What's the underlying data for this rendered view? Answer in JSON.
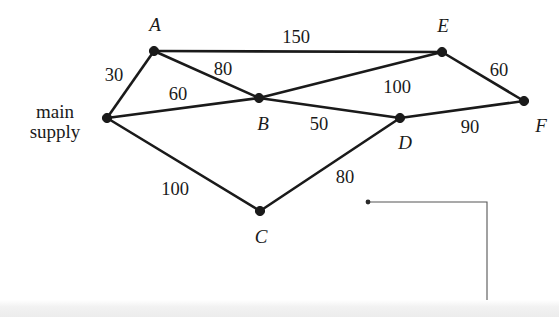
{
  "figure": {
    "type": "weighted-network-graph",
    "title": "",
    "background_color": "#ffffff",
    "edge_color": "#1a1a1a",
    "node_color": "#1a1a1a",
    "leader_color": "#555555"
  },
  "nodes": [
    {
      "id": "S",
      "label": "main\nsupply",
      "label_line1": "main",
      "label_line2": "supply",
      "x": 107,
      "y": 118,
      "label_x": 55,
      "label_y": 122,
      "label_kind": "text"
    },
    {
      "id": "A",
      "label": "A",
      "x": 154,
      "y": 51,
      "label_x": 155,
      "label_y": 25,
      "label_kind": "italic"
    },
    {
      "id": "B",
      "label": "B",
      "x": 259,
      "y": 98,
      "label_x": 263,
      "label_y": 124,
      "label_kind": "italic"
    },
    {
      "id": "C",
      "label": "C",
      "x": 260,
      "y": 211,
      "label_x": 261,
      "label_y": 237,
      "label_kind": "italic"
    },
    {
      "id": "D",
      "label": "D",
      "x": 400,
      "y": 118,
      "label_x": 405,
      "label_y": 143,
      "label_kind": "italic"
    },
    {
      "id": "E",
      "label": "E",
      "x": 442,
      "y": 52,
      "label_x": 443,
      "label_y": 26,
      "label_kind": "italic"
    },
    {
      "id": "F",
      "label": "F",
      "x": 524,
      "y": 101,
      "label_x": 541,
      "label_y": 126,
      "label_kind": "italic"
    }
  ],
  "edges": [
    {
      "from": "S",
      "to": "A",
      "weight": "30",
      "label_x": 114,
      "label_y": 76
    },
    {
      "from": "S",
      "to": "B",
      "weight": "60",
      "label_x": 178,
      "label_y": 95
    },
    {
      "from": "S",
      "to": "C",
      "weight": "100",
      "label_x": 175,
      "label_y": 190
    },
    {
      "from": "A",
      "to": "E",
      "weight": "150",
      "label_x": 296,
      "label_y": 38
    },
    {
      "from": "A",
      "to": "B",
      "weight": "80",
      "label_x": 223,
      "label_y": 70
    },
    {
      "from": "B",
      "to": "E",
      "weight": "100",
      "label_x": 397,
      "label_y": 88
    },
    {
      "from": "B",
      "to": "D",
      "weight": "50",
      "label_x": 319,
      "label_y": 125
    },
    {
      "from": "C",
      "to": "D",
      "weight": "80",
      "label_x": 345,
      "label_y": 178
    },
    {
      "from": "E",
      "to": "F",
      "weight": "60",
      "label_x": 499,
      "label_y": 71
    },
    {
      "from": "D",
      "to": "F",
      "weight": "90",
      "label_x": 470,
      "label_y": 128
    }
  ],
  "annotation": {
    "name": "leader-line",
    "dot_x": 368,
    "dot_y": 202,
    "corner_x": 487,
    "corner_y": 202,
    "end_x": 487,
    "end_y": 317
  },
  "chart_data": {
    "type": "graph",
    "vertices": [
      "main supply",
      "A",
      "B",
      "C",
      "D",
      "E",
      "F"
    ],
    "edges": [
      {
        "u": "main supply",
        "v": "A",
        "weight": 30
      },
      {
        "u": "main supply",
        "v": "B",
        "weight": 60
      },
      {
        "u": "main supply",
        "v": "C",
        "weight": 100
      },
      {
        "u": "A",
        "v": "E",
        "weight": 150
      },
      {
        "u": "A",
        "v": "B",
        "weight": 80
      },
      {
        "u": "B",
        "v": "E",
        "weight": 100
      },
      {
        "u": "B",
        "v": "D",
        "weight": 50
      },
      {
        "u": "C",
        "v": "D",
        "weight": 80
      },
      {
        "u": "E",
        "v": "F",
        "weight": 60
      },
      {
        "u": "D",
        "v": "F",
        "weight": 90
      }
    ],
    "weights": [
      30,
      60,
      100,
      150,
      80,
      100,
      50,
      80,
      60,
      90
    ],
    "xlabel": "",
    "ylabel": "",
    "grid": false,
    "legend": "none"
  }
}
